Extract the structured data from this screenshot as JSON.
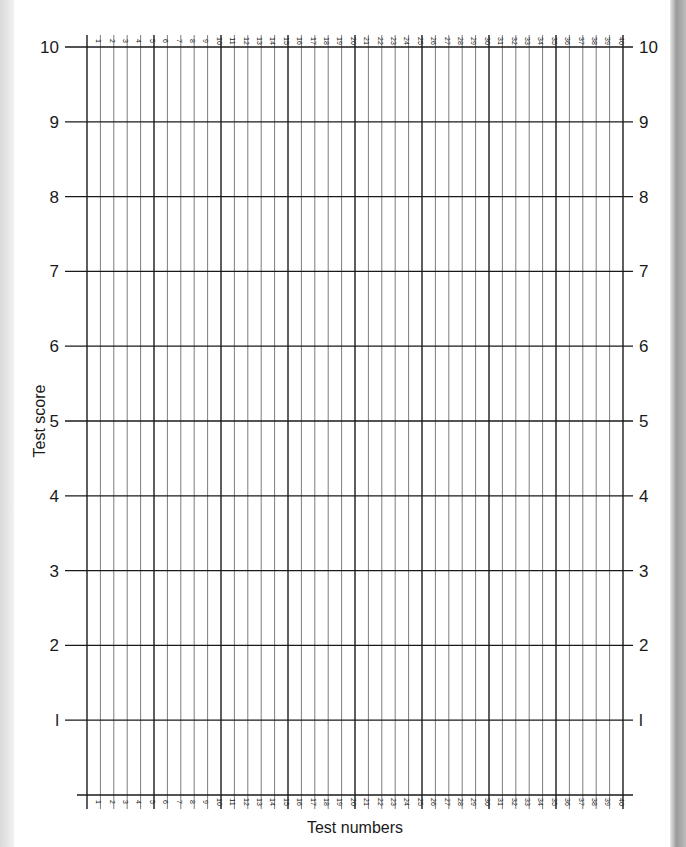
{
  "chart_data": {
    "type": "line",
    "title": "",
    "xlabel": "Test numbers",
    "ylabel": "Test score",
    "xlim": [
      0,
      40
    ],
    "ylim": [
      0,
      10
    ],
    "x_ticks": [
      1,
      2,
      3,
      4,
      5,
      6,
      7,
      8,
      9,
      10,
      11,
      12,
      13,
      14,
      15,
      16,
      17,
      18,
      19,
      20,
      21,
      22,
      23,
      24,
      25,
      26,
      27,
      28,
      29,
      30,
      31,
      32,
      33,
      34,
      35,
      36,
      37,
      38,
      39,
      40
    ],
    "y_ticks": [
      1,
      2,
      3,
      4,
      5,
      6,
      7,
      8,
      9,
      10
    ],
    "y_tick_labels": [
      "l",
      "2",
      "3",
      "4",
      "5",
      "6",
      "7",
      "8",
      "9",
      "10"
    ],
    "grid": true,
    "major_x_every": 5,
    "series": [],
    "note": "Blank score chart grid with 40 numbered test columns; y-axis labels on both sides; column numbers at top and bottom"
  },
  "colors": {
    "grid_major": "#1a1a1a",
    "grid_minor": "#6e6e6e",
    "text": "#1a1a1a"
  }
}
